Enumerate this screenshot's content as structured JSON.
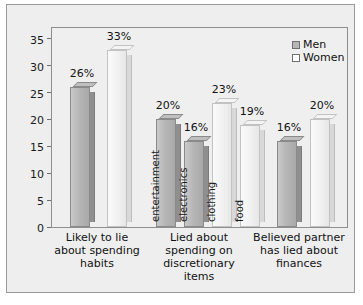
{
  "chart_data": {
    "type": "bar",
    "title": "",
    "subtitle": "",
    "xlabel": "",
    "ylabel": "",
    "ylim": [
      0,
      37
    ],
    "yticks": [
      0,
      5,
      10,
      15,
      20,
      25,
      30,
      35
    ],
    "ytick_labels": [
      "0",
      "5",
      "10",
      "15",
      "20",
      "25",
      "30",
      "35"
    ],
    "grid": false,
    "legend_position": "top-right",
    "legend": [
      {
        "name": "Men",
        "color": "#b6b6b6"
      },
      {
        "name": "Women",
        "color": "#ffffff"
      }
    ],
    "categories": [
      "Likely to lie about spending habits",
      "Lied about spending on discretionary items",
      "Believed partner has lied about finances"
    ],
    "series": [
      {
        "name": "Men",
        "values": [
          26,
          20,
          16
        ]
      },
      {
        "name": "Women",
        "values": [
          33,
          23,
          20
        ]
      }
    ],
    "bars": [
      {
        "group": 0,
        "series": "Men",
        "value": 26,
        "value_label": "26%",
        "inner_label": ""
      },
      {
        "group": 0,
        "series": "Women",
        "value": 33,
        "value_label": "33%",
        "inner_label": ""
      },
      {
        "group": 1,
        "series": "Men",
        "value": 20,
        "value_label": "20%",
        "inner_label": "entertainment"
      },
      {
        "group": 1,
        "series": "Men",
        "value": 16,
        "value_label": "16%",
        "inner_label": "electronics"
      },
      {
        "group": 1,
        "series": "Women",
        "value": 23,
        "value_label": "23%",
        "inner_label": "clothing"
      },
      {
        "group": 1,
        "series": "Women",
        "value": 19,
        "value_label": "19%",
        "inner_label": "food"
      },
      {
        "group": 2,
        "series": "Men",
        "value": 16,
        "value_label": "16%",
        "inner_label": ""
      },
      {
        "group": 2,
        "series": "Women",
        "value": 20,
        "value_label": "20%",
        "inner_label": ""
      }
    ],
    "category_lines": [
      [
        "Likely to lie",
        "about spending",
        "habits"
      ],
      [
        "Lied about",
        "spending on",
        "discretionary",
        "items"
      ],
      [
        "Believed partner",
        "has lied about",
        "finances"
      ]
    ]
  },
  "colors": {
    "men_bar": "#b6b6b6",
    "women_bar": "#f1f1f1",
    "card_background": "#eeeeee",
    "plot_background": "#efefef",
    "frame_border": "#8e8e8e",
    "text": "#111111"
  }
}
